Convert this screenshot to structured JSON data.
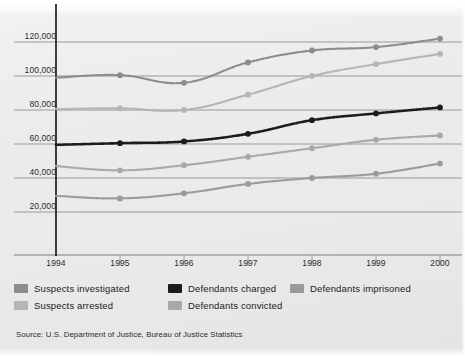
{
  "chart_data": {
    "type": "line",
    "title": "",
    "xlabel": "",
    "ylabel": "",
    "x": [
      1994,
      1995,
      1996,
      1997,
      1998,
      1999,
      2000
    ],
    "categories": [
      "1994",
      "1995",
      "1996",
      "1997",
      "1998",
      "1999",
      "2000"
    ],
    "xlim": [
      1994,
      2000
    ],
    "ylim": [
      0,
      130000
    ],
    "yticks": [
      20000,
      40000,
      60000,
      80000,
      100000,
      120000
    ],
    "ytick_labels": [
      "20,000",
      "40,000",
      "60,000",
      "80,000",
      "100,000",
      "120,000"
    ],
    "grid": "horizontal",
    "legend_position": "below-plot",
    "marker": "circle",
    "line_style": "dotted",
    "series": [
      {
        "name": "Suspects investigated",
        "color": "#8c8c8c",
        "values": [
          99000,
          100500,
          96000,
          108000,
          115000,
          117000,
          122000
        ]
      },
      {
        "name": "Suspects arrested",
        "color": "#b5b5b5",
        "values": [
          80500,
          81000,
          80000,
          89000,
          100000,
          107000,
          113000
        ]
      },
      {
        "name": "Defendants charged",
        "color": "#1c1c1c",
        "values": [
          59500,
          60500,
          61500,
          66000,
          74000,
          78000,
          81500
        ]
      },
      {
        "name": "Defendants convicted",
        "color": "#a8a8a8",
        "values": [
          47000,
          44500,
          47500,
          52500,
          57500,
          62500,
          65000
        ]
      },
      {
        "name": "Defendants imprisoned",
        "color": "#9a9a9a",
        "values": [
          29500,
          28000,
          31000,
          36500,
          40000,
          42500,
          48500
        ]
      }
    ]
  },
  "axis": {
    "y_axis_line_color": "#111111",
    "gridline_color": "#8f8f8f"
  },
  "legend": {
    "items": [
      {
        "label": "Suspects investigated",
        "color": "#8c8c8c",
        "col": 0,
        "row": 0
      },
      {
        "label": "Suspects arrested",
        "color": "#b5b5b5",
        "col": 0,
        "row": 1
      },
      {
        "label": "Defendants charged",
        "color": "#1c1c1c",
        "col": 1,
        "row": 0
      },
      {
        "label": "Defendants convicted",
        "color": "#a8a8a8",
        "col": 1,
        "row": 1
      },
      {
        "label": "Defendants imprisoned",
        "color": "#9a9a9a",
        "col": 2,
        "row": 0
      }
    ]
  },
  "source": {
    "text": "Source: U.S. Department of Justice, Bureau of Justice Statistics"
  }
}
